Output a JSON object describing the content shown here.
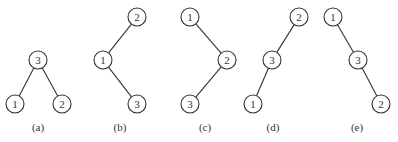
{
  "diagram": {
    "type": "binary-search-trees",
    "node_radius": 9,
    "stroke_color": "#333333",
    "fill_color": "#ffffff",
    "text_color": "#333333",
    "trees": [
      {
        "label": "(a)",
        "label_pos": [
          38,
          131
        ],
        "nodes": [
          {
            "id": "a3",
            "value": "3",
            "x": 38,
            "y": 60
          },
          {
            "id": "a1",
            "value": "1",
            "x": 15,
            "y": 104
          },
          {
            "id": "a2",
            "value": "2",
            "x": 62,
            "y": 104
          }
        ],
        "edges": [
          [
            "a3",
            "a1"
          ],
          [
            "a3",
            "a2"
          ]
        ]
      },
      {
        "label": "(b)",
        "label_pos": [
          120,
          131
        ],
        "nodes": [
          {
            "id": "b2",
            "value": "2",
            "x": 137,
            "y": 17
          },
          {
            "id": "b1",
            "value": "1",
            "x": 103,
            "y": 60
          },
          {
            "id": "b3",
            "value": "3",
            "x": 137,
            "y": 104
          }
        ],
        "edges": [
          [
            "b2",
            "b1"
          ],
          [
            "b1",
            "b3"
          ]
        ]
      },
      {
        "label": "(c)",
        "label_pos": [
          205,
          131
        ],
        "nodes": [
          {
            "id": "c1",
            "value": "1",
            "x": 190,
            "y": 17
          },
          {
            "id": "c2",
            "value": "2",
            "x": 227,
            "y": 60
          },
          {
            "id": "c3",
            "value": "3",
            "x": 190,
            "y": 104
          }
        ],
        "edges": [
          [
            "c1",
            "c2"
          ],
          [
            "c2",
            "c3"
          ]
        ]
      },
      {
        "label": "(d)",
        "label_pos": [
          273,
          131
        ],
        "nodes": [
          {
            "id": "d2",
            "value": "2",
            "x": 299,
            "y": 17
          },
          {
            "id": "d3",
            "value": "3",
            "x": 272,
            "y": 60
          },
          {
            "id": "d1",
            "value": "1",
            "x": 253,
            "y": 104
          }
        ],
        "edges": [
          [
            "d2",
            "d3"
          ],
          [
            "d3",
            "d1"
          ]
        ]
      },
      {
        "label": "(e)",
        "label_pos": [
          357,
          131
        ],
        "nodes": [
          {
            "id": "e1",
            "value": "1",
            "x": 333,
            "y": 17
          },
          {
            "id": "e3",
            "value": "3",
            "x": 358,
            "y": 60
          },
          {
            "id": "e2",
            "value": "2",
            "x": 381,
            "y": 104
          }
        ],
        "edges": [
          [
            "e1",
            "e3"
          ],
          [
            "e3",
            "e2"
          ]
        ]
      }
    ]
  }
}
